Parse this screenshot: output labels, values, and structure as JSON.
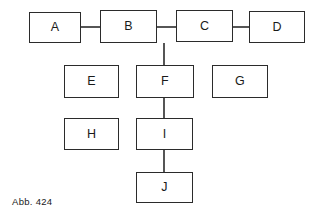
{
  "figure": {
    "caption": "Abb. 424",
    "background_color": "#ffffff",
    "line_color": "#2b2b2b",
    "text_color": "#1a1a1a"
  },
  "diagram_data": {
    "type": "diagram",
    "layout": "node-link block diagram",
    "nodes": [
      {
        "id": "A",
        "label": "A",
        "x": 29,
        "y": 12,
        "w": 52,
        "h": 31
      },
      {
        "id": "B",
        "label": "B",
        "x": 100,
        "y": 10,
        "w": 57,
        "h": 33
      },
      {
        "id": "C",
        "label": "C",
        "x": 176,
        "y": 10,
        "w": 57,
        "h": 32
      },
      {
        "id": "D",
        "label": "D",
        "x": 249,
        "y": 11,
        "w": 56,
        "h": 32
      },
      {
        "id": "E",
        "label": "E",
        "x": 64,
        "y": 65,
        "w": 55,
        "h": 33
      },
      {
        "id": "F",
        "label": "F",
        "x": 136,
        "y": 65,
        "w": 58,
        "h": 33
      },
      {
        "id": "G",
        "label": "G",
        "x": 212,
        "y": 65,
        "w": 56,
        "h": 33
      },
      {
        "id": "H",
        "label": "H",
        "x": 64,
        "y": 118,
        "w": 55,
        "h": 32
      },
      {
        "id": "I",
        "label": "I",
        "x": 136,
        "y": 118,
        "w": 57,
        "h": 32
      },
      {
        "id": "J",
        "label": "J",
        "x": 136,
        "y": 172,
        "w": 57,
        "h": 31
      }
    ],
    "edges": [
      {
        "from": "A",
        "to": "B",
        "orientation": "horizontal",
        "x1": 81,
        "y1": 27,
        "x2": 100,
        "y2": 27
      },
      {
        "from": "B",
        "to": "C",
        "orientation": "horizontal",
        "x1": 157,
        "y1": 27,
        "x2": 176,
        "y2": 27
      },
      {
        "from": "C",
        "to": "D",
        "orientation": "horizontal",
        "x1": 233,
        "y1": 27,
        "x2": 249,
        "y2": 27
      },
      {
        "from": "B",
        "to": "F",
        "orientation": "vertical",
        "x1": 164,
        "y1": 43,
        "x2": 164,
        "y2": 65
      },
      {
        "from": "F",
        "to": "I",
        "orientation": "vertical",
        "x1": 164,
        "y1": 98,
        "x2": 164,
        "y2": 118
      },
      {
        "from": "I",
        "to": "J",
        "orientation": "vertical",
        "x1": 164,
        "y1": 150,
        "x2": 164,
        "y2": 172
      }
    ],
    "isolated_nodes": [
      "E",
      "G",
      "H"
    ]
  }
}
